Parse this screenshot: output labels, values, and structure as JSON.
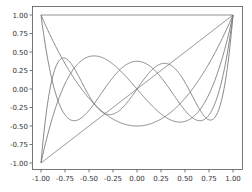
{
  "chart_data": {
    "type": "line",
    "title": "",
    "xlabel": "",
    "ylabel": "",
    "xlim": [
      -1.1,
      1.1
    ],
    "ylim": [
      -1.1,
      1.1
    ],
    "grid": false,
    "legend": null,
    "x_ticks": [
      "-1.00",
      "-0.75",
      "-0.50",
      "-0.25",
      "0.00",
      "0.25",
      "0.50",
      "0.75",
      "1.00"
    ],
    "y_ticks": [
      "-1.00",
      "-0.75",
      "-0.50",
      "-0.25",
      "0.00",
      "0.25",
      "0.50",
      "0.75",
      "1.00"
    ],
    "x_tick_values": [
      -1,
      -0.75,
      -0.5,
      -0.25,
      0,
      0.25,
      0.5,
      0.75,
      1
    ],
    "y_tick_values": [
      -1,
      -0.75,
      -0.5,
      -0.25,
      0,
      0.25,
      0.5,
      0.75,
      1
    ],
    "line_color": "#7a7a7a",
    "series": [
      {
        "name": "P0",
        "description": "Legendre P0 = 1",
        "coeffs": [
          1
        ]
      },
      {
        "name": "P1",
        "description": "Legendre P1 = x",
        "coeffs": [
          0,
          1
        ]
      },
      {
        "name": "P2",
        "description": "Legendre P2 = (3x^2-1)/2",
        "coeffs": [
          -0.5,
          0,
          1.5
        ]
      },
      {
        "name": "P3",
        "description": "Legendre P3 = (5x^3-3x)/2",
        "coeffs": [
          0,
          -1.5,
          0,
          2.5
        ]
      },
      {
        "name": "P4",
        "description": "Legendre P4 = (35x^4-30x^2+3)/8",
        "coeffs": [
          0.375,
          0,
          -3.75,
          0,
          4.375
        ]
      },
      {
        "name": "P5",
        "description": "Legendre P5 = (63x^5-70x^3+15x)/8",
        "coeffs": [
          0,
          1.875,
          0,
          -8.75,
          0,
          7.875
        ]
      }
    ]
  }
}
